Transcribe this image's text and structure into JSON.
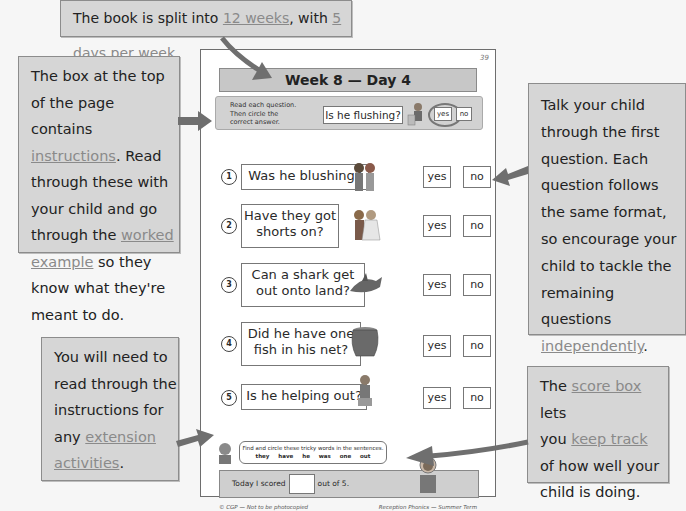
{
  "callouts": {
    "top": {
      "pre": "The book is split into ",
      "link1": "12 weeks",
      "mid": ", with ",
      "link2": "5 days per week",
      "post": "."
    },
    "left_top": {
      "line1": "The box at the top",
      "line2": "of the page contains",
      "link_instructions": "instructions",
      "after_instructions": ".  Read",
      "line4": "through these with",
      "line5": "your child and go",
      "line6_pre": "through the ",
      "link_worked": "worked",
      "link_example": "example",
      "line7_post": " so they",
      "line8": "know what they're",
      "line9": "meant to do."
    },
    "left_bottom": {
      "line1": "You will need to",
      "line2": "read through the",
      "line3": "instructions for",
      "line4_pre": "any ",
      "link_extension": "extension",
      "link_activities": "activities",
      "post": "."
    },
    "right_top": {
      "line1": "Talk your child",
      "line2": "through the first",
      "line3": "question.  Each",
      "line4": "question follows",
      "line5": "the same format,",
      "line6": "so encourage your",
      "line7": "child to tackle the",
      "line8": "remaining questions",
      "link_independently": "independently",
      "post": "."
    },
    "right_bottom": {
      "pre": "The ",
      "link_score_box": "score box",
      "after": " lets",
      "line2_pre": "you ",
      "link_keep_track": "keep track",
      "line3": "of how well your",
      "line4": "child is doing."
    }
  },
  "worksheet": {
    "page_number": "39",
    "title": "Week 8 — Day 4",
    "instructions": {
      "line1": "Read each question.",
      "line2": "Then circle the",
      "line3": "correct answer.",
      "example_question": "Is he flushing?",
      "example_yes": "yes",
      "example_no": "no",
      "example_selected": "yes"
    },
    "questions": [
      {
        "num": "1",
        "line1": "Was he blushing?",
        "line2": "",
        "picture": "children-kissing-icon",
        "yes": "yes",
        "no": "no"
      },
      {
        "num": "2",
        "line1": "Have they got",
        "line2": "shorts on?",
        "picture": "wedding-couple-icon",
        "yes": "yes",
        "no": "no"
      },
      {
        "num": "3",
        "line1": "Can a shark get",
        "line2": "out onto land?",
        "picture": "shark-icon",
        "yes": "yes",
        "no": "no"
      },
      {
        "num": "4",
        "line1": "Did he have one",
        "line2": "fish in his net?",
        "picture": "fishing-net-icon",
        "yes": "yes",
        "no": "no"
      },
      {
        "num": "5",
        "line1": "Is he helping out?",
        "line2": "",
        "picture": "boy-helping-icon",
        "yes": "yes",
        "no": "no"
      }
    ],
    "extension": {
      "instruction": "Find and circle these tricky words in the sentences.",
      "words": "they have he was one out"
    },
    "score": {
      "pre": "Today I scored",
      "post": "out of 5."
    },
    "footer_left": "© CGP — Not to be photocopied",
    "footer_right": "Reception Phonics — Summer Term"
  },
  "colors": {
    "callout_bg": "#d6d6d6",
    "link_gray": "#8a8a8a",
    "arrow": "#6f6f6f"
  }
}
